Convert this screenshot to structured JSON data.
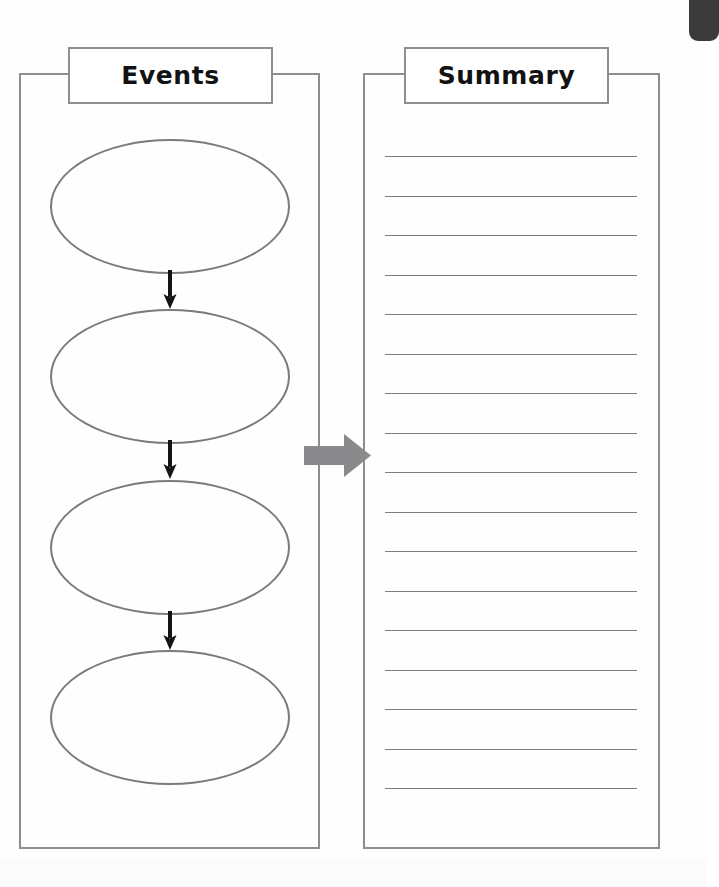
{
  "document": {
    "type": "graphic-organizer-worksheet",
    "background_color": "#ffffff",
    "ink_color": "#8e8e90",
    "text_color": "#121212"
  },
  "events_panel": {
    "title": "Events",
    "shape_count": 4,
    "shapes": [
      {
        "index": 1,
        "kind": "ellipse",
        "text": ""
      },
      {
        "index": 2,
        "kind": "ellipse",
        "text": ""
      },
      {
        "index": 3,
        "kind": "ellipse",
        "text": ""
      },
      {
        "index": 4,
        "kind": "ellipse",
        "text": ""
      }
    ],
    "connectors": [
      {
        "index": 1,
        "kind": "down-arrow",
        "from": 1,
        "to": 2
      },
      {
        "index": 2,
        "kind": "down-arrow",
        "from": 2,
        "to": 3
      },
      {
        "index": 3,
        "kind": "down-arrow",
        "from": 3,
        "to": 4
      }
    ]
  },
  "transition": {
    "kind": "block-arrow-right",
    "color": "#8a8a8c",
    "from": "Events",
    "to": "Summary"
  },
  "summary_panel": {
    "title": "Summary",
    "line_count": 17,
    "lines": [
      {
        "index": 1,
        "text": ""
      },
      {
        "index": 2,
        "text": ""
      },
      {
        "index": 3,
        "text": ""
      },
      {
        "index": 4,
        "text": ""
      },
      {
        "index": 5,
        "text": ""
      },
      {
        "index": 6,
        "text": ""
      },
      {
        "index": 7,
        "text": ""
      },
      {
        "index": 8,
        "text": ""
      },
      {
        "index": 9,
        "text": ""
      },
      {
        "index": 10,
        "text": ""
      },
      {
        "index": 11,
        "text": ""
      },
      {
        "index": 12,
        "text": ""
      },
      {
        "index": 13,
        "text": ""
      },
      {
        "index": 14,
        "text": ""
      },
      {
        "index": 15,
        "text": ""
      },
      {
        "index": 16,
        "text": ""
      },
      {
        "index": 17,
        "text": ""
      }
    ]
  },
  "artifacts": {
    "spine_shadow_color": "#3a3a3c"
  }
}
